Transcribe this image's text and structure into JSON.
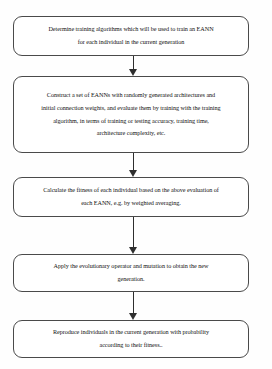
{
  "diagram": {
    "background_color": "#fefefe",
    "node_border_color": "#4a4a4a",
    "arrow_color": "#2e2e2e",
    "nodes": [
      {
        "id": "determine-training-algorithms",
        "lines": [
          "Determine training algorithms which will be used to train an EANN",
          "for each individual in the current generation"
        ]
      },
      {
        "id": "construct-eanns",
        "lines": [
          "Construct a set of EANNs with randomly generated architectures and",
          "initial connection weights, and evaluate them by training with the training",
          "algorithm, in terms of training or testing accuracy, training time,",
          "architecture complexity, etc."
        ]
      },
      {
        "id": "calculate-fitness",
        "lines": [
          "Calculate the fitness of each individual based on the above evaluation of",
          "each EANN, e.g. by weighted averaging."
        ]
      },
      {
        "id": "apply-evolutionary-operator",
        "lines": [
          "Apply the evolutionary  operator and mutation to obtain the new",
          "generation."
        ]
      },
      {
        "id": "reproduce-individuals",
        "lines": [
          "Reproduce  individuals in the current generation with probability",
          "according to their fitness.."
        ]
      }
    ],
    "connectors": [
      {
        "id": "arrow-1",
        "from": "determine-training-algorithms",
        "to": "construct-eanns"
      },
      {
        "id": "arrow-2",
        "from": "construct-eanns",
        "to": "calculate-fitness"
      },
      {
        "id": "arrow-3",
        "from": "calculate-fitness",
        "to": "apply-evolutionary-operator"
      },
      {
        "id": "arrow-4",
        "from": "apply-evolutionary-operator",
        "to": "reproduce-individuals"
      }
    ]
  }
}
